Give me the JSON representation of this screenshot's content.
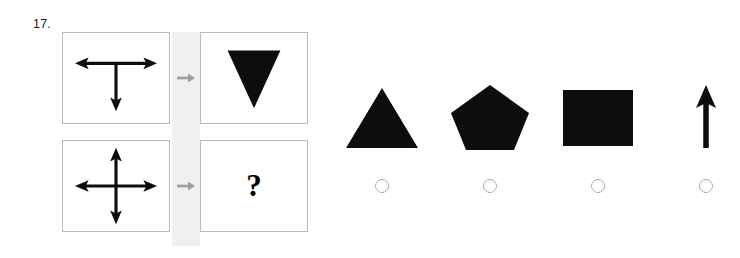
{
  "question": {
    "number": "17.",
    "type": "visual-analogy-matrix"
  },
  "matrix": {
    "rows": [
      {
        "stimulus": {
          "icon": "t-arrow-figure",
          "description": "Horizontal double-headed arrow with downward arrow from center"
        },
        "transform_icon": "gray-right-arrow",
        "result": {
          "icon": "down-triangle-shape",
          "description": "Solid black downward-pointing triangle"
        }
      },
      {
        "stimulus": {
          "icon": "cross-arrow-figure",
          "description": "Four-way double-headed cross arrow"
        },
        "transform_icon": "gray-right-arrow",
        "result": {
          "icon": "question-mark",
          "label": "?"
        }
      }
    ]
  },
  "options": [
    {
      "id": "option-1",
      "icon": "up-triangle-shape",
      "label": "",
      "selected": false
    },
    {
      "id": "option-2",
      "icon": "pentagon-shape",
      "label": "",
      "selected": false
    },
    {
      "id": "option-3",
      "icon": "square-shape",
      "label": "",
      "selected": false
    },
    {
      "id": "option-4",
      "icon": "up-arrow-shape",
      "label": "",
      "selected": false
    }
  ],
  "colors": {
    "shape_fill": "#0d0d0d",
    "panel_border": "#b9bcc0",
    "separator_band": "#f0f0f0",
    "transform_arrow": "#9a9da1",
    "radio_border": "#a8abaf",
    "background": "#ffffff"
  }
}
